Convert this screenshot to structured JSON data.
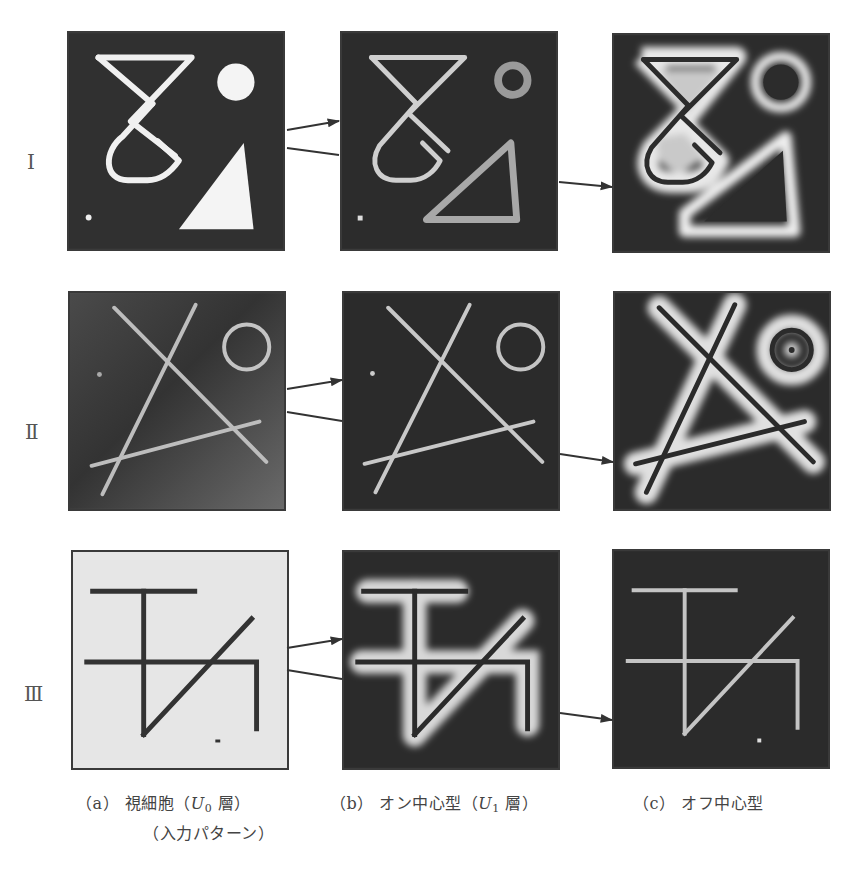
{
  "figure": {
    "rows": [
      {
        "id": "I",
        "label": "Ⅰ"
      },
      {
        "id": "II",
        "label": "Ⅱ"
      },
      {
        "id": "III",
        "label": "Ⅲ"
      }
    ],
    "columns": [
      {
        "id": "a",
        "tag": "（a）",
        "name": "視細胞（",
        "var": "U",
        "sub": "0",
        "layer": " 層）",
        "line2": "（入力パターン）"
      },
      {
        "id": "b",
        "tag": "（b）",
        "name": "オン中心型（",
        "var": "U",
        "sub": "1",
        "layer": " 層）",
        "line2": ""
      },
      {
        "id": "c",
        "tag": "（c）",
        "name": "オフ中心型",
        "var": "",
        "sub": "",
        "layer": "",
        "line2": ""
      }
    ],
    "colors": {
      "dark_bg": "#2e2e2e",
      "light_bg": "#e4e4e4",
      "bright_stroke": "#f2f2f2",
      "mid_stroke": "#bdbdbd",
      "dark_stroke": "#333333",
      "arrow": "#333333"
    },
    "arrows": [
      {
        "row": "I",
        "from": [
          287,
          130
        ],
        "to": [
          339,
          121
        ],
        "head": true
      },
      {
        "row": "I",
        "from": [
          287,
          148
        ],
        "to": [
          339,
          155
        ],
        "head": false
      },
      {
        "row": "I",
        "from": [
          559,
          182
        ],
        "to": [
          612,
          187
        ],
        "head": true
      },
      {
        "row": "II",
        "from": [
          287,
          389
        ],
        "to": [
          342,
          380
        ],
        "head": true
      },
      {
        "row": "II",
        "from": [
          287,
          412
        ],
        "to": [
          342,
          421
        ],
        "head": false
      },
      {
        "row": "II",
        "from": [
          560,
          454
        ],
        "to": [
          613,
          462
        ],
        "head": true
      },
      {
        "row": "III",
        "from": [
          287,
          648
        ],
        "to": [
          342,
          639
        ],
        "head": true
      },
      {
        "row": "III",
        "from": [
          287,
          670
        ],
        "to": [
          342,
          679
        ],
        "head": false
      },
      {
        "row": "III",
        "from": [
          560,
          713
        ],
        "to": [
          612,
          720
        ],
        "head": true
      }
    ]
  }
}
